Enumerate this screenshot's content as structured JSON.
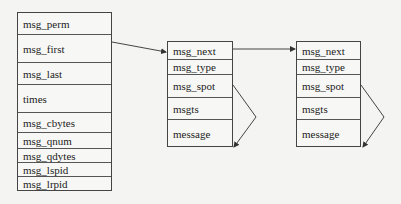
{
  "diagram": {
    "type": "linked-list-structure",
    "queue_struct": {
      "fields": [
        {
          "label": "msg_perm",
          "top": 0,
          "height": 22
        },
        {
          "label": "msg_first",
          "top": 22,
          "height": 28
        },
        {
          "label": "msg_last",
          "top": 50,
          "height": 22
        },
        {
          "label": "times",
          "top": 72,
          "height": 28
        },
        {
          "label": "msg_cbytes",
          "top": 100,
          "height": 20
        },
        {
          "label": "msg_qnum",
          "top": 120,
          "height": 16
        },
        {
          "label": "msg_qdytes",
          "top": 136,
          "height": 14
        },
        {
          "label": "msg_lspid",
          "top": 150,
          "height": 14
        },
        {
          "label": "msg_lrpid",
          "top": 164,
          "height": 14
        }
      ]
    },
    "message_nodes": [
      {
        "fields": [
          {
            "label": "msg_next",
            "top": 0,
            "height": 18
          },
          {
            "label": "msg_type",
            "top": 18,
            "height": 15
          },
          {
            "label": "msg_spot",
            "top": 33,
            "height": 23
          },
          {
            "label": "msgts",
            "top": 56,
            "height": 22
          },
          {
            "label": "message",
            "top": 78,
            "height": 28
          }
        ]
      },
      {
        "fields": [
          {
            "label": "msg_next",
            "top": 0,
            "height": 18
          },
          {
            "label": "msg_type",
            "top": 18,
            "height": 15
          },
          {
            "label": "msg_spot",
            "top": 33,
            "height": 23
          },
          {
            "label": "msgts",
            "top": 56,
            "height": 22
          },
          {
            "label": "message",
            "top": 78,
            "height": 28
          }
        ]
      }
    ],
    "edges": [
      {
        "from": "msg_first",
        "to": "node1.msg_next"
      },
      {
        "from": "node1.msg_next",
        "to": "node2.msg_next"
      },
      {
        "from": "node1.msg_spot",
        "to": "node1.message"
      },
      {
        "from": "node2.msg_spot",
        "to": "node2.message"
      }
    ],
    "colors": {
      "line": "#444444",
      "background": "#f4f4f2"
    }
  }
}
